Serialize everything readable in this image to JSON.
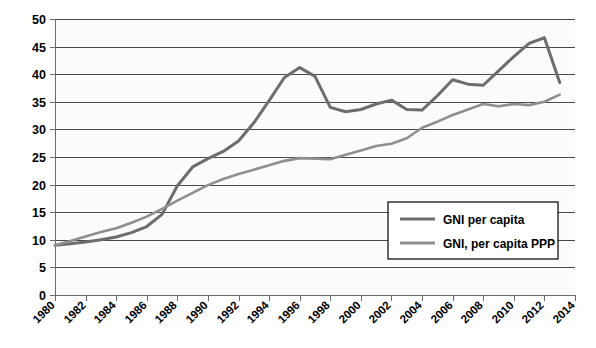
{
  "chart_data": {
    "type": "line",
    "title": "",
    "xlabel": "",
    "ylabel": "",
    "xlim": [
      1980,
      2014
    ],
    "ylim": [
      0,
      50
    ],
    "grid": true,
    "legend_position": "bottom-right",
    "x": [
      1980,
      1981,
      1982,
      1983,
      1984,
      1985,
      1986,
      1987,
      1988,
      1989,
      1990,
      1991,
      1992,
      1993,
      1994,
      1995,
      1996,
      1997,
      1998,
      1999,
      2000,
      2001,
      2002,
      2003,
      2004,
      2005,
      2006,
      2007,
      2008,
      2009,
      2010,
      2011,
      2012,
      2013
    ],
    "xticks": [
      "1980",
      "1982",
      "1984",
      "1986",
      "1988",
      "1990",
      "1992",
      "1994",
      "1996",
      "1998",
      "2000",
      "2002",
      "2004",
      "2006",
      "2008",
      "2010",
      "2012",
      "2014"
    ],
    "yticks": [
      "0",
      "5",
      "10",
      "15",
      "20",
      "25",
      "30",
      "35",
      "40",
      "45",
      "50"
    ],
    "series": [
      {
        "name": "GNI per capita",
        "color": "#6d6d6d",
        "values": [
          9.0,
          9.3,
          9.6,
          10.0,
          10.5,
          11.3,
          12.4,
          14.6,
          19.8,
          23.2,
          24.7,
          26.0,
          27.9,
          31.2,
          35.2,
          39.4,
          41.2,
          39.6,
          34.0,
          33.2,
          33.6,
          34.6,
          35.3,
          33.6,
          33.5,
          36.1,
          39.0,
          38.2,
          38.0,
          40.6,
          43.2,
          45.6,
          46.6,
          38.5
        ]
      },
      {
        "name": "GNI, per capita PPP",
        "color": "#8f8f8f",
        "values": [
          9.0,
          9.8,
          10.6,
          11.4,
          12.1,
          13.1,
          14.2,
          15.6,
          17.1,
          18.5,
          19.9,
          21.0,
          21.9,
          22.7,
          23.5,
          24.3,
          24.8,
          24.7,
          24.6,
          25.4,
          26.2,
          27.0,
          27.4,
          28.4,
          30.3,
          31.4,
          32.6,
          33.6,
          34.6,
          34.2,
          34.6,
          34.4,
          35.0,
          36.3
        ]
      }
    ],
    "legend": [
      {
        "label": "GNI per capita",
        "color": "#6d6d6d"
      },
      {
        "label": "GNI, per capita PPP",
        "color": "#8f8f8f"
      }
    ]
  }
}
